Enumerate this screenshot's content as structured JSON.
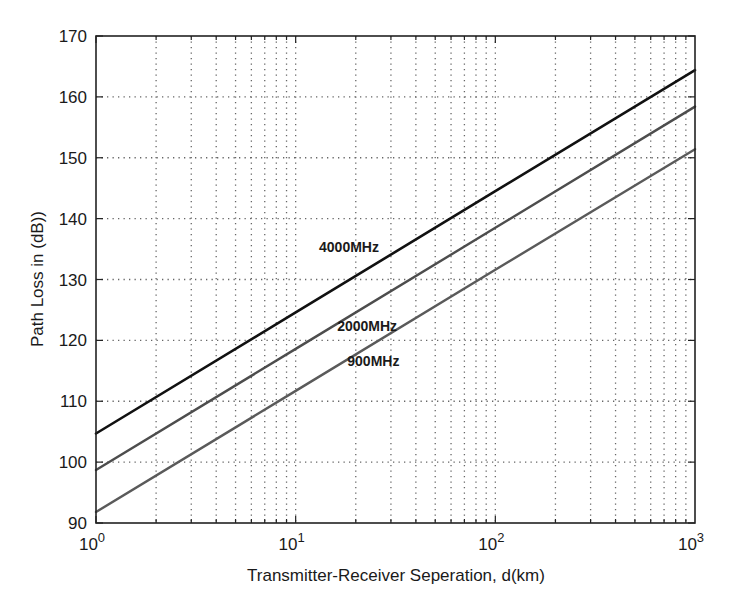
{
  "chart_data": {
    "type": "line",
    "title": "",
    "xlabel": "Transmitter-Receiver Seperation, d(km)",
    "ylabel": "Path Loss in (dB))",
    "xscale": "log",
    "xlim": [
      1,
      1000
    ],
    "ylim": [
      90,
      170
    ],
    "grid": true,
    "legend": "inline labels",
    "x_tick_labels": [
      {
        "base": "10",
        "exp": "0",
        "value": 1
      },
      {
        "base": "10",
        "exp": "1",
        "value": 10
      },
      {
        "base": "10",
        "exp": "2",
        "value": 100
      },
      {
        "base": "10",
        "exp": "3",
        "value": 1000
      }
    ],
    "y_ticks": [
      90,
      100,
      110,
      120,
      130,
      140,
      150,
      160,
      170
    ],
    "x": [
      1,
      10,
      100,
      1000
    ],
    "series": [
      {
        "name": "4000MHz",
        "values": [
          104.7,
          124.6,
          144.5,
          164.4
        ],
        "color": "#111111",
        "width": 2.6,
        "label_pos": {
          "x": 18.5,
          "y": 134.5
        }
      },
      {
        "name": "2000MHz",
        "values": [
          98.7,
          118.6,
          138.5,
          158.4
        ],
        "color": "#4d4d4d",
        "width": 2.4,
        "label_pos": {
          "x": 22.8,
          "y": 121.6
        }
      },
      {
        "name": "900MHz",
        "values": [
          91.8,
          111.7,
          131.6,
          151.4
        ],
        "color": "#5a5a5a",
        "width": 2.4,
        "label_pos": {
          "x": 24.5,
          "y": 115.8
        }
      }
    ]
  }
}
